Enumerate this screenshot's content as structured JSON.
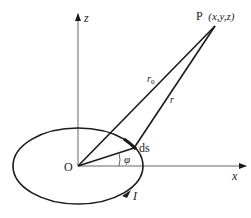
{
  "diagram": {
    "point_label": "P",
    "point_coords": "(x,y,z)",
    "z_axis_label": "z",
    "x_axis_label": "x",
    "origin_label": "O",
    "r0_label": "r",
    "r0_subscript": "0",
    "r_label": "r",
    "ds_label": "ds",
    "phi_label": "φ",
    "current_label": "I",
    "colors": {
      "stroke": "#1a1a1a",
      "background": "#ffffff"
    }
  }
}
